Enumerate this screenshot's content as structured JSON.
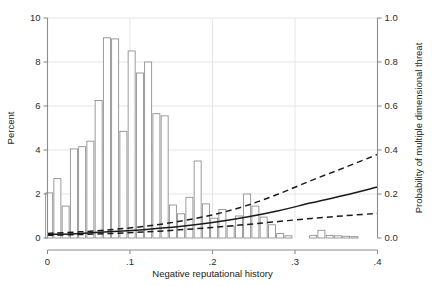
{
  "chart_data": {
    "type": "bar",
    "title": "",
    "subtitle": "",
    "xlabel": "Negative reputational history",
    "ylabel": "Percent",
    "y2label": "Probability of multiple dimensional threat",
    "xlim": [
      0,
      0.4
    ],
    "ylim": [
      0,
      10
    ],
    "y2lim": [
      0.0,
      1.0
    ],
    "grid": true,
    "legend": null,
    "x_ticks": [
      "0",
      ".1",
      ".2",
      ".3",
      ".4"
    ],
    "x_tick_values": [
      0,
      0.1,
      0.2,
      0.3,
      0.4
    ],
    "y_ticks": [
      "0",
      "2",
      "4",
      "6",
      "8",
      "10"
    ],
    "y_tick_values": [
      0,
      2,
      4,
      6,
      8,
      10
    ],
    "y2_ticks": [
      "0.0",
      "0.2",
      "0.4",
      "0.6",
      "0.8",
      "1.0"
    ],
    "y2_tick_values": [
      0.0,
      0.2,
      0.4,
      0.6,
      0.8,
      1.0
    ],
    "bar_width": 0.0085,
    "histogram": {
      "name": "Percent",
      "axis": "left",
      "x": [
        0.002,
        0.012,
        0.022,
        0.032,
        0.042,
        0.052,
        0.062,
        0.072,
        0.082,
        0.092,
        0.102,
        0.112,
        0.122,
        0.132,
        0.142,
        0.152,
        0.162,
        0.172,
        0.182,
        0.192,
        0.202,
        0.212,
        0.222,
        0.232,
        0.242,
        0.252,
        0.262,
        0.272,
        0.282,
        0.292,
        0.322,
        0.332,
        0.342,
        0.352,
        0.362,
        0.372
      ],
      "values": [
        2.05,
        2.7,
        1.45,
        4.05,
        4.15,
        4.4,
        6.25,
        9.1,
        9.05,
        4.85,
        8.5,
        7.5,
        8.0,
        5.65,
        5.55,
        1.5,
        1.1,
        1.85,
        3.5,
        1.55,
        0.9,
        1.3,
        0.55,
        1.0,
        2.0,
        1.45,
        0.95,
        0.6,
        0.2,
        0.1,
        0.12,
        0.35,
        0.12,
        0.1,
        0.08,
        0.06
      ]
    },
    "series": [
      {
        "name": "Predicted probability",
        "axis": "right",
        "style": "solid",
        "color": "#1a1a1a",
        "x": [
          0.0,
          0.04,
          0.08,
          0.12,
          0.16,
          0.2,
          0.24,
          0.28,
          0.32,
          0.36,
          0.4
        ],
        "values": [
          0.016,
          0.021,
          0.029,
          0.039,
          0.052,
          0.07,
          0.094,
          0.124,
          0.16,
          0.194,
          0.232
        ]
      },
      {
        "name": "Upper 95% confidence limit",
        "axis": "right",
        "style": "dashed",
        "color": "#1a1a1a",
        "x": [
          0.0,
          0.04,
          0.08,
          0.12,
          0.16,
          0.2,
          0.24,
          0.28,
          0.32,
          0.36,
          0.4
        ],
        "values": [
          0.021,
          0.028,
          0.039,
          0.054,
          0.076,
          0.105,
          0.146,
          0.2,
          0.262,
          0.32,
          0.38
        ]
      },
      {
        "name": "Lower 95% confidence limit",
        "axis": "right",
        "style": "dashed",
        "color": "#1a1a1a",
        "x": [
          0.0,
          0.04,
          0.08,
          0.12,
          0.16,
          0.2,
          0.24,
          0.28,
          0.32,
          0.36,
          0.4
        ],
        "values": [
          0.012,
          0.016,
          0.021,
          0.028,
          0.037,
          0.048,
          0.061,
          0.075,
          0.089,
          0.101,
          0.112
        ]
      }
    ],
    "colors": {
      "bar_stroke": "#8a8a8a",
      "bar_fill": "#ffffff",
      "grid": "#e2e2e2",
      "axis": "#8c8c8c",
      "text": "#2b2b2b",
      "curve": "#1a1a1a"
    }
  }
}
